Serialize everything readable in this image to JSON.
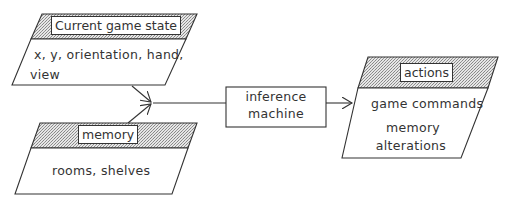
{
  "diagram": {
    "nodes": {
      "current_state": {
        "title": "Current game state",
        "body_line1": "x,  y,  orientation,  hand,",
        "body_line2": "view"
      },
      "memory": {
        "title": "memory",
        "body": "rooms,  shelves"
      },
      "inference": {
        "line1": "inference",
        "line2": "machine"
      },
      "actions": {
        "title": "actions",
        "body_line1": "game  commands",
        "body_line2": "memory",
        "body_line3": "alterations"
      }
    },
    "edges": [
      {
        "from": "current_state",
        "to": "junction"
      },
      {
        "from": "memory",
        "to": "junction"
      },
      {
        "from": "junction",
        "to": "inference"
      },
      {
        "from": "inference",
        "to": "actions"
      }
    ],
    "colors": {
      "stroke": "#333333",
      "hatch": "#bdbdbd",
      "background": "#ffffff"
    }
  }
}
